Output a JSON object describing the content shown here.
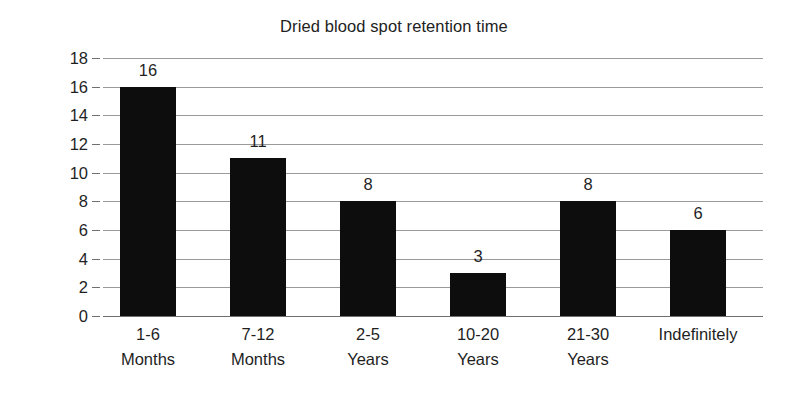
{
  "chart_data": {
    "type": "bar",
    "title": "Dried blood spot retention time",
    "xlabel": "",
    "ylabel": "Number of states",
    "categories": [
      "1-6 Months",
      "7-12 Months",
      "2-5 Years",
      "10-20 Years",
      "21-30 Years",
      "Indefinitely"
    ],
    "category_lines": [
      [
        "1-6",
        "Months"
      ],
      [
        "7-12",
        "Months"
      ],
      [
        "2-5",
        "Years"
      ],
      [
        "10-20",
        "Years"
      ],
      [
        "21-30",
        "Years"
      ],
      [
        "Indefinitely",
        ""
      ]
    ],
    "values": [
      16,
      11,
      8,
      3,
      8,
      6
    ],
    "data_labels": [
      "16",
      "11",
      "8",
      "3",
      "8",
      "6"
    ],
    "ylim": [
      0,
      18
    ],
    "ytick_step": 2,
    "ytick_labels": [
      "18",
      "16",
      "14",
      "12",
      "10",
      "8",
      "6",
      "4",
      "2",
      "0"
    ],
    "grid": true,
    "legend": false,
    "bar_color": "#0d0d0d",
    "gridline_color": "#9a9a9a",
    "axis_color": "#6f6f6f",
    "background_color": "#ffffff",
    "text_color": "#1f1f1f"
  }
}
